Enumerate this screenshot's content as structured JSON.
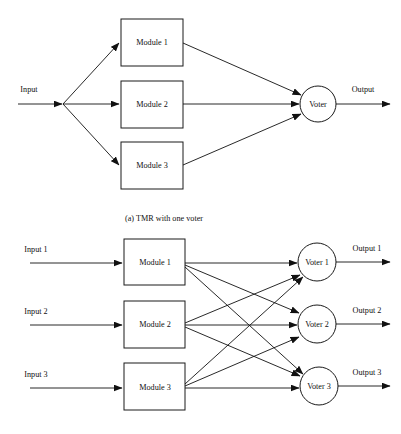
{
  "figure": {
    "background_color": "#ffffff",
    "line_color": "#111111",
    "text_color": "#111111",
    "width": 401,
    "height": 434
  },
  "panel_a": {
    "caption": "(a) TMR with one voter",
    "input_label": "Input",
    "output_label": "Output",
    "modules": [
      {
        "label": "Module 1"
      },
      {
        "label": "Module 2"
      },
      {
        "label": "Module 3"
      }
    ],
    "voter": {
      "label": "Voter"
    }
  },
  "panel_b": {
    "inputs": [
      {
        "label": "Input 1"
      },
      {
        "label": "Input 2"
      },
      {
        "label": "Input 3"
      }
    ],
    "modules": [
      {
        "label": "Module 1"
      },
      {
        "label": "Module 2"
      },
      {
        "label": "Module 3"
      }
    ],
    "voters": [
      {
        "label": "Voter 1"
      },
      {
        "label": "Voter 2"
      },
      {
        "label": "Voter 3"
      }
    ],
    "outputs": [
      {
        "label": "Output 1"
      },
      {
        "label": "Output 2"
      },
      {
        "label": "Output 3"
      }
    ]
  }
}
